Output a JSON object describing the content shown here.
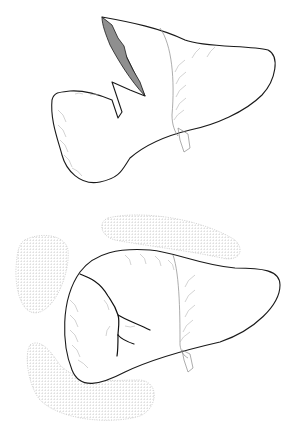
{
  "figure": {
    "panels": [
      {
        "id": "top",
        "description": "Liver with laceration on left lobe (shaded wound)"
      },
      {
        "id": "bottom",
        "description": "Liver with branching fracture line, surrounded by packing"
      }
    ],
    "colors": {
      "outline": "#1a1a1a",
      "wound_fill": "#8f8f8f",
      "hatching": "#b5b5b5",
      "packing": "#c4c4c4",
      "background": "#ffffff"
    }
  }
}
